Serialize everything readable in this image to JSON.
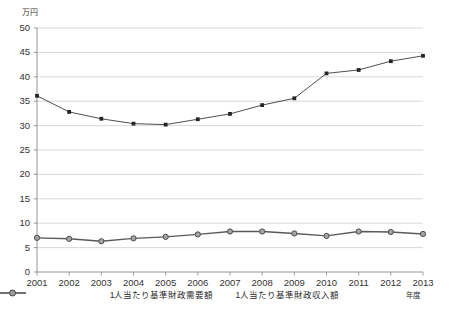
{
  "chart_data": {
    "type": "line",
    "title": "",
    "subtitle": "",
    "unit_label": "万円",
    "xlabel": "年度",
    "ylabel": "",
    "ylim": [
      0,
      50
    ],
    "ytick_step": 5,
    "yticks": [
      "50",
      "45",
      "40",
      "35",
      "30",
      "25",
      "20",
      "15",
      "10",
      "5",
      "0"
    ],
    "categories": [
      "2001",
      "2002",
      "2003",
      "2004",
      "2005",
      "2006",
      "2007",
      "2008",
      "2009",
      "2010",
      "2011",
      "2012",
      "2013"
    ],
    "grid": true,
    "legend_position": "bottom",
    "series": [
      {
        "name": "1人当たり基準財政需要額",
        "marker": "square",
        "color": "#3a3a3a",
        "values": [
          36.1,
          32.8,
          31.4,
          30.4,
          30.2,
          31.3,
          32.4,
          34.2,
          35.6,
          40.7,
          41.4,
          43.2,
          44.3
        ]
      },
      {
        "name": "1人当たり基準財政収入額",
        "marker": "circle",
        "color": "#5a5a5a",
        "values": [
          7.0,
          6.8,
          6.3,
          6.9,
          7.2,
          7.7,
          8.3,
          8.3,
          7.9,
          7.4,
          8.3,
          8.2,
          7.8
        ]
      }
    ]
  },
  "axes": {
    "unit": "万円",
    "x_axis_note": "年度"
  },
  "legend": {
    "items": [
      {
        "label": "1人当たり基準財政需要額"
      },
      {
        "label": "1人当たり基準財政収入額"
      }
    ]
  },
  "colors": {
    "series1": "#3a3a3a",
    "series2": "#5a5a5a",
    "grid": "#c9c9c9",
    "axis": "#8a8a8a",
    "text": "#2b2b2b"
  }
}
